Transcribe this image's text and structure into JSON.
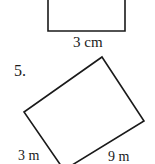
{
  "problem_4": {
    "shape": "rectangle",
    "bottom_side_label": "3 cm"
  },
  "problem_5": {
    "number": "5.",
    "shape": "rotated rectangle",
    "left_side_label": "3 m",
    "right_side_label": "9 m"
  },
  "colors": {
    "line": "#1a1a1a",
    "background": "#ffffff"
  }
}
